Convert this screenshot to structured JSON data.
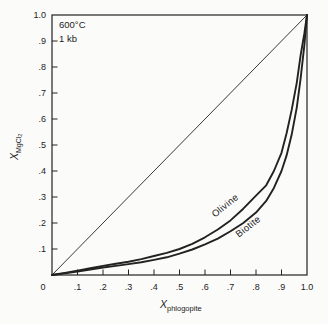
{
  "figure": {
    "background_color": "#fbfbfa",
    "line_color": "#222222",
    "annotation": {
      "temperature": "600°C",
      "pressure": "1 kb"
    }
  },
  "chart_data": {
    "type": "line",
    "title": "",
    "xlabel_main": "X",
    "xlabel_sub": "phlogopite",
    "ylabel_main": "X",
    "ylabel_sub": "MgCl",
    "ylabel_sub2": "2",
    "xlim": [
      0,
      1
    ],
    "ylim": [
      0,
      1
    ],
    "grid": false,
    "x_tick_labels": [
      {
        "v": 0.0,
        "label": "0"
      },
      {
        "v": 0.1,
        "label": ".1"
      },
      {
        "v": 0.2,
        "label": ".2"
      },
      {
        "v": 0.3,
        "label": ".3"
      },
      {
        "v": 0.4,
        "label": ".4"
      },
      {
        "v": 0.5,
        "label": ".5"
      },
      {
        "v": 0.6,
        "label": ".6"
      },
      {
        "v": 0.7,
        "label": ".7"
      },
      {
        "v": 0.8,
        "label": ".8"
      },
      {
        "v": 0.9,
        "label": ".9"
      },
      {
        "v": 1.0,
        "label": "1.0"
      }
    ],
    "y_tick_labels": [
      {
        "v": 0.1,
        "label": ".1"
      },
      {
        "v": 0.2,
        "label": ".2"
      },
      {
        "v": 0.3,
        "label": ".3"
      },
      {
        "v": 0.4,
        "label": ".4"
      },
      {
        "v": 0.5,
        "label": ".5"
      },
      {
        "v": 0.6,
        "label": ".6"
      },
      {
        "v": 0.7,
        "label": ".7"
      },
      {
        "v": 0.8,
        "label": ".8"
      },
      {
        "v": 0.9,
        "label": ".9"
      },
      {
        "v": 1.0,
        "label": "1.0"
      }
    ],
    "tick_values": [
      0.1,
      0.2,
      0.3,
      0.4,
      0.5,
      0.6,
      0.7,
      0.8,
      0.9
    ],
    "reference_line": {
      "from": [
        0,
        0
      ],
      "to": [
        1,
        1
      ]
    },
    "series": [
      {
        "name": "Olivine",
        "label_pos": {
          "x": 227,
          "y": 208,
          "angle": -39
        },
        "points": [
          [
            0,
            0
          ],
          [
            0.05,
            0.008
          ],
          [
            0.1,
            0.017
          ],
          [
            0.15,
            0.026
          ],
          [
            0.2,
            0.035
          ],
          [
            0.25,
            0.043
          ],
          [
            0.3,
            0.051
          ],
          [
            0.35,
            0.061
          ],
          [
            0.4,
            0.073
          ],
          [
            0.45,
            0.085
          ],
          [
            0.5,
            0.1
          ],
          [
            0.55,
            0.12
          ],
          [
            0.6,
            0.145
          ],
          [
            0.65,
            0.175
          ],
          [
            0.7,
            0.21
          ],
          [
            0.75,
            0.255
          ],
          [
            0.8,
            0.305
          ],
          [
            0.84,
            0.345
          ],
          [
            0.87,
            0.4
          ],
          [
            0.9,
            0.47
          ],
          [
            0.92,
            0.545
          ],
          [
            0.94,
            0.635
          ],
          [
            0.96,
            0.74
          ],
          [
            0.975,
            0.845
          ],
          [
            0.99,
            0.93
          ],
          [
            1,
            1
          ]
        ]
      },
      {
        "name": "Biotite",
        "label_pos": {
          "x": 250,
          "y": 229,
          "angle": -38
        },
        "points": [
          [
            0,
            0
          ],
          [
            0.05,
            0.006
          ],
          [
            0.1,
            0.013
          ],
          [
            0.15,
            0.021
          ],
          [
            0.2,
            0.029
          ],
          [
            0.25,
            0.035
          ],
          [
            0.3,
            0.042
          ],
          [
            0.35,
            0.049
          ],
          [
            0.4,
            0.058
          ],
          [
            0.45,
            0.068
          ],
          [
            0.5,
            0.082
          ],
          [
            0.55,
            0.098
          ],
          [
            0.6,
            0.118
          ],
          [
            0.65,
            0.14
          ],
          [
            0.7,
            0.168
          ],
          [
            0.75,
            0.2
          ],
          [
            0.8,
            0.24
          ],
          [
            0.84,
            0.285
          ],
          [
            0.87,
            0.335
          ],
          [
            0.9,
            0.4
          ],
          [
            0.92,
            0.46
          ],
          [
            0.94,
            0.54
          ],
          [
            0.96,
            0.645
          ],
          [
            0.975,
            0.755
          ],
          [
            0.99,
            0.885
          ],
          [
            1,
            1
          ]
        ]
      }
    ]
  }
}
